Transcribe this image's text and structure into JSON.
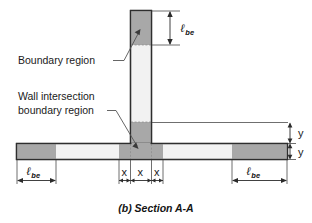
{
  "figure": {
    "caption": "(b) Section A-A",
    "annotations": [
      {
        "id": "boundary-region",
        "text": "Boundary region"
      },
      {
        "id": "wall-intersection-line1",
        "text": "Wall intersection"
      },
      {
        "id": "wall-intersection-line2",
        "text": "boundary region"
      }
    ],
    "dimensions": {
      "lbe_symbol": "ℓ",
      "lbe_subscript": "be",
      "x_label": "x",
      "y_label": "y",
      "vertical_wall_lbe": "ℓbe",
      "left_flange_lbe": "ℓbe",
      "right_flange_lbe": "ℓbe",
      "intersection_segments": [
        "x",
        "x",
        "x"
      ],
      "thickness_segments": [
        "y",
        "y"
      ]
    },
    "colors": {
      "boundary_fill": "#a8a8a8",
      "web_fill": "#f2f2f2",
      "outline": "#2e2e2e",
      "text": "#1a1a1a",
      "leader": "#555555",
      "background": "#ffffff"
    },
    "geometry": {
      "vertical_wall": {
        "x": 130,
        "y": 10,
        "width": 22,
        "height": 135
      },
      "vertical_boundary_height": 34,
      "horizontal_wall": {
        "x": 16,
        "y": 143,
        "width": 272,
        "height": 17
      },
      "left_boundary_width": 39,
      "right_boundary_width": 39,
      "intersection_x_start": 119,
      "intersection_x_width": 22
    }
  }
}
